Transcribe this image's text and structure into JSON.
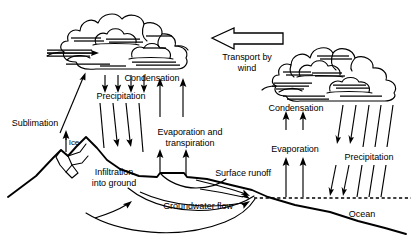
{
  "diagram": {
    "type": "process-diagram",
    "background_color": "#ffffff",
    "ink_color": "#000000",
    "width": 413,
    "height": 249
  },
  "labels": {
    "sublimation": "Sublimation",
    "ice": "Ice",
    "precipitation_left": "Precipitation",
    "condensation_left": "Condensation",
    "transport_by_wind": "Transport by\nwind",
    "condensation_right": "Condensation",
    "evaporation_and_transpiration": "Evaporation and\ntranspiration",
    "infiltration_into_ground": "Infiltration\ninto ground",
    "surface_runoff": "Surface runoff",
    "groundwater_flow": "Groundwater flow",
    "evaporation_right": "Evaporation",
    "precipitation_right": "Precipitation",
    "ocean": "Ocean"
  },
  "elements": {
    "cloud_left": "cloud-left-icon",
    "cloud_right": "cloud-right-icon",
    "transport_arrow": "left-arrow-icon",
    "mountain": "mountain-terrain",
    "ice_cap": "ice-cap-shape",
    "sea_level": "sea-level-dashed-line",
    "ocean_floor": "ocean-floor-line",
    "aquifer": "groundwater-aquifer-lines"
  },
  "flows": [
    {
      "name": "sublimation",
      "direction": "up",
      "from": "ice",
      "to": "cloud_left"
    },
    {
      "name": "precipitation_left",
      "direction": "down",
      "from": "cloud_left",
      "to": "mountain"
    },
    {
      "name": "condensation_left",
      "direction": "up",
      "from": "land",
      "to": "cloud_left"
    },
    {
      "name": "evaporation_and_transpiration",
      "direction": "up",
      "from": "land",
      "to": "cloud_left"
    },
    {
      "name": "transport_by_wind",
      "direction": "left",
      "from": "cloud_right",
      "to": "cloud_left"
    },
    {
      "name": "condensation_right",
      "direction": "up",
      "from": "ocean",
      "to": "cloud_right"
    },
    {
      "name": "evaporation_right",
      "direction": "up",
      "from": "ocean",
      "to": "cloud_right"
    },
    {
      "name": "precipitation_right",
      "direction": "down",
      "from": "cloud_right",
      "to": "ocean"
    },
    {
      "name": "surface_runoff",
      "direction": "right",
      "from": "mountain",
      "to": "ocean"
    },
    {
      "name": "groundwater_flow",
      "direction": "right",
      "from": "infiltration",
      "to": "ocean"
    }
  ]
}
